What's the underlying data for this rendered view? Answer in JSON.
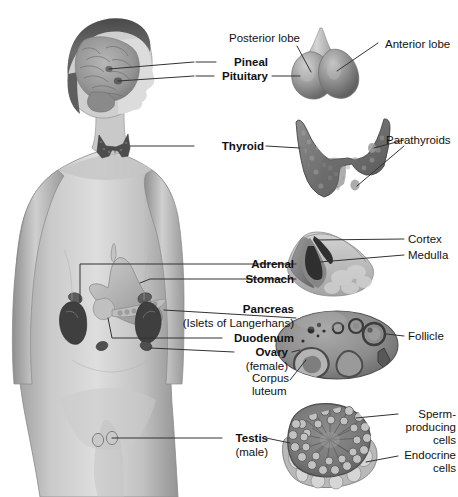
{
  "labels": {
    "posterior_lobe": "Posterior lobe",
    "anterior_lobe": "Anterior lobe",
    "pineal": "Pineal",
    "pituitary": "Pituitary",
    "thyroid": "Thyroid",
    "parathyroids": "Parathyroids",
    "cortex": "Cortex",
    "medulla": "Medulla",
    "adrenal": "Adrenal",
    "stomach": "Stomach",
    "pancreas": "Pancreas",
    "islets": "(Islets of Langerhans)",
    "duodenum": "Duodenum",
    "ovary": "Ovary",
    "female": "(female)",
    "follicle": "Follicle",
    "corpus": "Corpus",
    "luteum": "luteum",
    "testis": "Testis",
    "male": "(male)",
    "sperm1": "Sperm-",
    "sperm2": "producing",
    "sperm3": "cells",
    "endocrine1": "Endocrine",
    "endocrine2": "cells"
  },
  "colors": {
    "leader": "#333333",
    "text": "#111111",
    "skin_light": "#d8d8d8",
    "skin_mid": "#b6b6b6",
    "skin_dark": "#8f8f8f",
    "organ_dark": "#4a4a4a",
    "organ_mid": "#7d7d7d",
    "organ_light": "#b0b0b0",
    "background": "#ffffff"
  }
}
